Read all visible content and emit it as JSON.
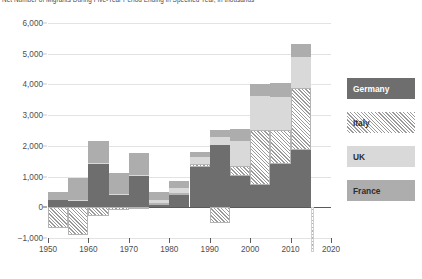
{
  "chart_data": {
    "type": "bar",
    "stacked": true,
    "title": "Net Number of Migrants During Five-Year Period Ending in Specified Year, in thousands",
    "xlabel": "",
    "ylabel": "",
    "ylim": [
      -1000,
      6000
    ],
    "ytick_values": [
      6000,
      5000,
      4000,
      3000,
      2000,
      1000,
      0,
      -1000
    ],
    "ytick_labels": [
      "6,000",
      "5,000",
      "4,000",
      "3,000",
      "2,000",
      "1,000",
      "0",
      "−1,000"
    ],
    "grid": true,
    "legend_position": "right",
    "xtick_labels": [
      "1950",
      "1960",
      "1970",
      "1980",
      "1990",
      "2000",
      "2010",
      "2020"
    ],
    "xtick_values": [
      1950,
      1960,
      1970,
      1980,
      1990,
      2000,
      2010,
      2020
    ],
    "x": [
      1955,
      1960,
      1965,
      1970,
      1975,
      1980,
      1985,
      1990,
      1995,
      2000,
      2005,
      2010,
      2015,
      2020
    ],
    "series": [
      {
        "name": "Germany",
        "color": "#6e6e6e",
        "pattern": "solid",
        "values": [
          230,
          230,
          1400,
          390,
          1010,
          90,
          390,
          1300,
          2020,
          1010,
          740,
          1420,
          1870,
          1100
        ]
      },
      {
        "name": "Italy",
        "color": "#9a9a9a",
        "pattern": "diagonal-hatch",
        "values": [
          -690,
          -900,
          -280,
          -80,
          -20,
          40,
          70,
          110,
          -510,
          340,
          1780,
          1090,
          2010,
          1090
        ]
      },
      {
        "name": "UK",
        "color": "#d9d9d9",
        "pattern": "solid",
        "values": [
          0,
          20,
          50,
          40,
          50,
          120,
          170,
          220,
          280,
          800,
          1090,
          1090,
          1010,
          960
        ]
      },
      {
        "name": "France",
        "color": "#adadad",
        "pattern": "solid",
        "values": [
          260,
          700,
          700,
          700,
          700,
          240,
          210,
          170,
          230,
          400,
          420,
          460,
          440,
          370
        ]
      }
    ],
    "annotations": [
      {
        "name": "projection-marker",
        "at_x": 2020,
        "style": "diagonal-hatch",
        "note": "narrow hatched sliver at the right edge spanning from 0 down past the -1,000 line"
      }
    ]
  },
  "legend": {
    "items": [
      {
        "label": "Germany",
        "key": "germany"
      },
      {
        "label": "Italy",
        "key": "italy"
      },
      {
        "label": "UK",
        "key": "uk"
      },
      {
        "label": "France",
        "key": "france"
      }
    ]
  }
}
